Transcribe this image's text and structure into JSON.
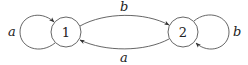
{
  "diagram": {
    "type": "state-machine",
    "nodes": [
      {
        "id": "1",
        "label": "1",
        "cx": 66,
        "cy": 32,
        "r": 15
      },
      {
        "id": "2",
        "label": "2",
        "cx": 183,
        "cy": 32,
        "r": 15
      }
    ],
    "edges": [
      {
        "from": "1",
        "to": "1",
        "label": "a",
        "kind": "self-loop-left"
      },
      {
        "from": "1",
        "to": "2",
        "label": "b",
        "kind": "arc-top"
      },
      {
        "from": "2",
        "to": "1",
        "label": "a",
        "kind": "arc-bottom"
      },
      {
        "from": "2",
        "to": "2",
        "label": "b",
        "kind": "self-loop-right"
      }
    ],
    "colors": {
      "stroke": "#555555",
      "text": "#222222",
      "background": "#ffffff"
    }
  }
}
